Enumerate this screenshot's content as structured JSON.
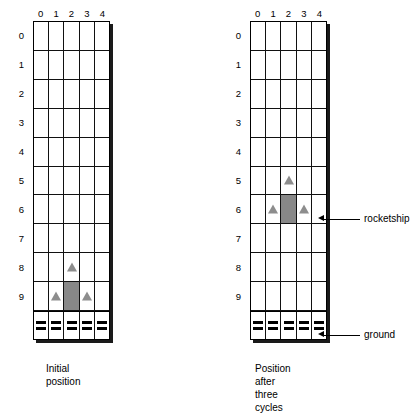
{
  "figure": {
    "grid": {
      "columns": 5,
      "rows": 10,
      "col_labels": [
        "0",
        "1",
        "2",
        "3",
        "4"
      ],
      "row_labels": [
        "0",
        "1",
        "2",
        "3",
        "4",
        "5",
        "6",
        "7",
        "8",
        "9"
      ],
      "ground_label": "ground",
      "ground_cells": 5,
      "ground_dashes_per_cell": 2
    },
    "colors": {
      "rocketship_body": "#888888",
      "rocketship_fin": "#8d8d8d",
      "grid_line": "#111111",
      "grid_border": "#000000",
      "shadow": "#1a1a1a",
      "background": "#ffffff",
      "text": "#000000"
    },
    "panels": [
      {
        "id": "initial",
        "caption": "Initial\nposition",
        "rocketship": {
          "body_row": 9,
          "body_col": 2,
          "nose_row": 8,
          "nose_col": 2,
          "fin_rows": [
            9,
            9
          ],
          "fin_cols": [
            1,
            3
          ]
        }
      },
      {
        "id": "after-three-cycles",
        "caption": "Position after\nthree cycles",
        "rocketship": {
          "body_row": 6,
          "body_col": 2,
          "nose_row": 5,
          "nose_col": 2,
          "fin_rows": [
            6,
            6
          ],
          "fin_cols": [
            1,
            3
          ]
        }
      }
    ],
    "annotations": [
      {
        "id": "rocketship",
        "label": "rocketship"
      },
      {
        "id": "ground",
        "label": "ground"
      }
    ]
  }
}
